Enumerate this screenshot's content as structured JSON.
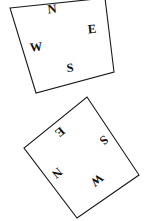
{
  "figure": {
    "background_color": "#ffffff",
    "stroke_color": "#1a1a1a",
    "text_color": "#111111",
    "width": 149,
    "height": 221,
    "shapes": [
      {
        "id": "top-square",
        "name": "upper-compass-square",
        "kind": "square",
        "rotation_deg": -7,
        "points": "10,8 105,-2 114,72 36,93",
        "labels": [
          {
            "id": "top-n",
            "text": "N",
            "x": 52,
            "y": 9,
            "rotation_deg": -6,
            "direction": "north"
          },
          {
            "id": "top-e",
            "text": "E",
            "x": 92,
            "y": 29,
            "rotation_deg": -6,
            "direction": "east"
          },
          {
            "id": "top-w",
            "text": "W",
            "x": 36,
            "y": 47,
            "rotation_deg": -6,
            "direction": "west"
          },
          {
            "id": "top-s",
            "text": "S",
            "x": 70,
            "y": 68,
            "rotation_deg": -6,
            "direction": "south"
          }
        ]
      },
      {
        "id": "bottom-square",
        "name": "lower-compass-square",
        "kind": "square",
        "rotation_deg": 138,
        "points": "87,97 139,175 77,218 24,148",
        "labels": [
          {
            "id": "bot-e",
            "text": "E",
            "x": 60,
            "y": 132,
            "rotation_deg": 140,
            "direction": "east"
          },
          {
            "id": "bot-s",
            "text": "S",
            "x": 104,
            "y": 140,
            "rotation_deg": 140,
            "direction": "south"
          },
          {
            "id": "bot-n",
            "text": "N",
            "x": 57,
            "y": 173,
            "rotation_deg": 140,
            "direction": "north"
          },
          {
            "id": "bot-w",
            "text": "W",
            "x": 97,
            "y": 180,
            "rotation_deg": 140,
            "direction": "west"
          }
        ]
      }
    ]
  }
}
